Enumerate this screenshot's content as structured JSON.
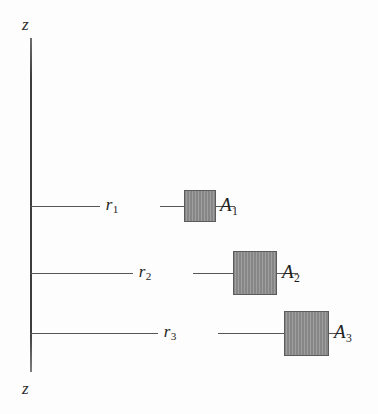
{
  "figure": {
    "background_color": "#fdfdfd",
    "width": 378,
    "height": 414
  },
  "axis": {
    "name": "z-axis",
    "orientation": "vertical",
    "color": "#3d3d3d",
    "top_label": "z",
    "bottom_label": "z",
    "x": 30,
    "y_top": 38,
    "y_bottom": 372
  },
  "patch_style": {
    "fill_color": "#8d8d8d",
    "border_color": "#5b5b5b",
    "hatch": "fine-vertical"
  },
  "rows": [
    {
      "id": "row-1",
      "radius_label": "r",
      "radius_subscript": "1",
      "area_label": "A",
      "area_subscript": "1",
      "line_y": 206,
      "label_x": 112,
      "leader_left_width": 70,
      "leader_right_start": 130,
      "leader_right_width": 75,
      "patch_x": 184,
      "patch_y": 190,
      "patch_w": 32,
      "patch_h": 32,
      "area_label_x": 220
    },
    {
      "id": "row-2",
      "radius_label": "r",
      "radius_subscript": "2",
      "area_label": "A",
      "area_subscript": "2",
      "line_y": 273,
      "label_x": 145,
      "leader_left_width": 103,
      "leader_right_start": 163,
      "leader_right_width": 105,
      "patch_x": 233,
      "patch_y": 251,
      "patch_w": 44,
      "patch_h": 44,
      "area_label_x": 282
    },
    {
      "id": "row-3",
      "radius_label": "r",
      "radius_subscript": "3",
      "area_label": "A",
      "area_subscript": "3",
      "line_y": 333,
      "label_x": 170,
      "leader_left_width": 128,
      "leader_right_start": 188,
      "leader_right_width": 120,
      "patch_x": 284,
      "patch_y": 311,
      "patch_w": 45,
      "patch_h": 45,
      "area_label_x": 334
    }
  ]
}
